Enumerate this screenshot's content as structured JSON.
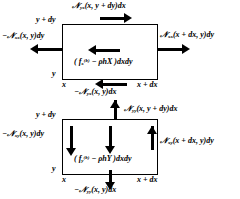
{
  "figure": {
    "stroke_color": "#000000",
    "background_color": "#ffffff"
  },
  "diagram_x": {
    "name": "x-direction force balance element",
    "top_force": "N<sub>yx</sub>(x, y + dy)dx",
    "left_force": "&minus;N<sub>xx</sub>(x, y)dy",
    "right_force": "N<sub>xx</sub>(x + dx, y)dy",
    "body_force": "( f<sub>x</sub><sup>(b)</sup> &minus; &rho;hX )dxdy",
    "bottom_force": "&minus;N<sub>yx</sub>(x, y)dx",
    "coord_top_left": "y + dy",
    "coord_bottom_left_y": "y",
    "coord_bottom_left_x": "x",
    "coord_bottom_right": "x + dx",
    "arrows": {
      "top": "right",
      "left": "left",
      "right": "right",
      "center": "left",
      "bottom": "left"
    }
  },
  "diagram_y": {
    "name": "y-direction force balance element",
    "top_force": "N<sub>yy</sub>(x, y + dy)dx",
    "left_force": "&minus;N<sub>xy</sub>(x, y)dy",
    "right_force": "N<sub>xy</sub>(x + dx, y)dy",
    "body_force": "( f<sub>y</sub><sup>(b)</sup> &minus; &rho;hY )dxdy",
    "bottom_force": "&minus;N<sub>yy</sub>(x, y)dx",
    "coord_top_left": "y + dy",
    "coord_bottom_left_y": "y",
    "coord_bottom_left_x": "x",
    "coord_bottom_right": "x + dx",
    "arrows": {
      "top": "up",
      "left": "down",
      "right": "up",
      "center": "down",
      "bottom": "down"
    }
  }
}
